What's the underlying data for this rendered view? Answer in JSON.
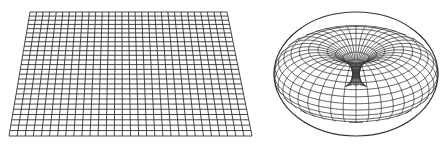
{
  "figure": {
    "panels": [
      {
        "name": "flat-grid-plane",
        "shape": "plane",
        "columns": 30,
        "rows": 26,
        "corners": {
          "top_left": [
            30,
            12
          ],
          "top_right": [
            227,
            12
          ],
          "bottom_right": [
            252,
            136
          ],
          "bottom_left": [
            9,
            136
          ]
        }
      },
      {
        "name": "torus-wireframe",
        "shape": "torus",
        "center": [
          356,
          74
        ],
        "outer_rx": 82,
        "outer_ry": 62,
        "meridians": 40,
        "parallels": 26
      }
    ],
    "colors": {
      "line": "#333333",
      "background": "#ffffff"
    }
  }
}
